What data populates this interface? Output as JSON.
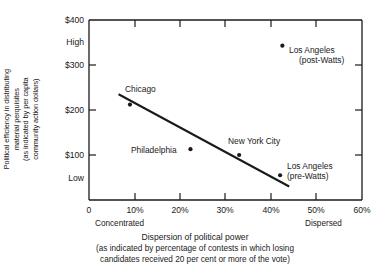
{
  "chart_data": {
    "type": "scatter",
    "title": "",
    "xlabel": "Dispersion of political power",
    "xlabel_sub_line1": "(as indicated by percentage of contests in which losing",
    "xlabel_sub_line2": "candidates received 20 per cent or more of the vote)",
    "ylabel_line1": "Political efficiency in distributing",
    "ylabel_line2": "material perquisites",
    "ylabel_line3": "(as indicated by per capita",
    "ylabel_line4": "community action dollars)",
    "xlim": [
      0,
      60
    ],
    "ylim": [
      0,
      400
    ],
    "xticks": [
      "0",
      "10%",
      "20%",
      "30%",
      "40%",
      "50%",
      "60%"
    ],
    "xtick_values": [
      0,
      10,
      20,
      30,
      40,
      50,
      60
    ],
    "yticks": [
      "$400",
      "$300",
      "$200",
      "$100"
    ],
    "ytick_values": [
      400,
      300,
      200,
      100
    ],
    "y_qualitative": [
      "High",
      "Low"
    ],
    "y_qualitative_values": [
      350,
      50
    ],
    "x_end_left": "Concentrated",
    "x_end_right": "Dispersed",
    "grid": false,
    "legend": "none",
    "points": [
      {
        "label_line1": "Chicago",
        "label_line2": "",
        "x": 9.0,
        "y": 212
      },
      {
        "label_line1": "Philadelphia",
        "label_line2": "",
        "x": 22.3,
        "y": 113
      },
      {
        "label_line1": "New York City",
        "label_line2": "",
        "x": 33.0,
        "y": 100
      },
      {
        "label_line1": "Los Angeles",
        "label_line2": "(pre-Watts)",
        "x": 42.0,
        "y": 55
      },
      {
        "label_line1": "Los Angeles",
        "label_line2": "(post-Watts)",
        "x": 42.5,
        "y": 343
      }
    ],
    "trend_line": {
      "x1": 6.5,
      "y1": 235,
      "x2": 44.0,
      "y2": 30
    }
  }
}
